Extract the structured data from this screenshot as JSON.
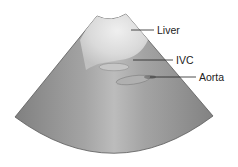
{
  "diagram": {
    "type": "ultrasound-sector-schematic",
    "labels": [
      {
        "id": "liver",
        "text": "Liver"
      },
      {
        "id": "ivc",
        "text": "IVC"
      },
      {
        "id": "aorta",
        "text": "Aorta"
      }
    ],
    "colors": {
      "background": "#ffffff",
      "sector_edge": "#7a7a7a",
      "sector_center": "#b8b8b8",
      "liver_highlight": "#e6e6e6",
      "vessel_fill": "#c2c2c2",
      "aorta_spot": "#6e6e6e",
      "leader_line": "#222222",
      "label_text": "#222222"
    }
  }
}
